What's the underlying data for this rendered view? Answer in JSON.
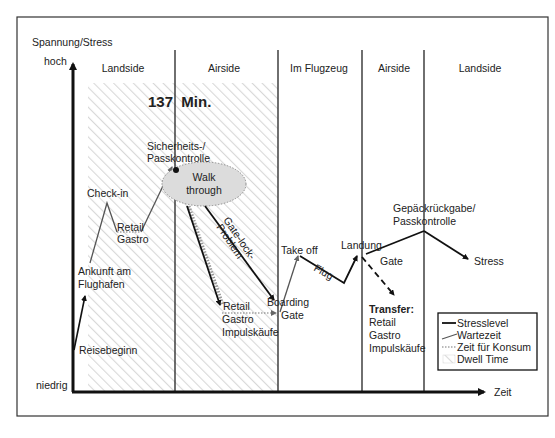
{
  "axes": {
    "y_label": "Spannung/Stress",
    "y_high": "hoch",
    "y_low": "niedrig",
    "x_label": "Zeit"
  },
  "sections": [
    {
      "label": "Landside"
    },
    {
      "label": "Airside"
    },
    {
      "label": "Im Flugzeug"
    },
    {
      "label": "Airside"
    },
    {
      "label": "Landside"
    }
  ],
  "dwell": {
    "label": "137  Min."
  },
  "points": {
    "reisebeginn": "Reisebeginn",
    "ankunft_1": "Ankunft am",
    "ankunft_2": "Flughafen",
    "checkin": "Check-in",
    "retail_1": "Retail",
    "retail_2": "Gastro",
    "sicherheit_1": "Sicherheits-/",
    "sicherheit_2": "Passkontrolle",
    "walk_1": "Walk",
    "walk_2": "through",
    "gatelock_1": "Gate-lock-",
    "gatelock_2": "Problem",
    "retail2_1": "Retail",
    "retail2_2": "Gastro",
    "retail2_3": "Impulskäufe",
    "boarding_1": "Boarding",
    "boarding_2": "Gate",
    "takeoff": "Take off",
    "flug": "Flug",
    "landung": "Landung",
    "gate": "Gate",
    "gepaeck_1": "Gepäckrückgabe/",
    "gepaeck_2": "Passkontrolle",
    "stress": "Stress",
    "transfer_1": "Transfer:",
    "transfer_2": "Retail",
    "transfer_3": "Gastro",
    "transfer_4": "Impulskäufe"
  },
  "legend": {
    "items": [
      {
        "label": "Stresslevel",
        "style": "solid-thick"
      },
      {
        "label": "Wartezeit",
        "style": "solid-thin"
      },
      {
        "label": "Zeit für Konsum",
        "style": "dotted"
      },
      {
        "label": "Dwell Time",
        "style": "hatched"
      }
    ]
  },
  "colors": {
    "stress_line": "#111111",
    "wait_line": "#555555",
    "consume_line": "#777777",
    "dwell_fill": "#e6e6e6",
    "walk_fill": "#dcdcdc"
  }
}
